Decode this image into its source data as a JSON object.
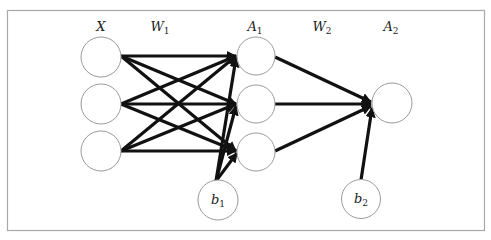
{
  "diagram": {
    "type": "neural-network",
    "colors": {
      "edge": "#111111",
      "node_stroke": "#9a9a9a",
      "frame": "#a8a8a8",
      "background": "#ffffff"
    },
    "labels": {
      "input": {
        "base": "X",
        "sub": ""
      },
      "weights1": {
        "base": "W",
        "sub": "1"
      },
      "hidden": {
        "base": "A",
        "sub": "1"
      },
      "weights2": {
        "base": "W",
        "sub": "2"
      },
      "output": {
        "base": "A",
        "sub": "2"
      },
      "bias1": {
        "base": "b",
        "sub": "1"
      },
      "bias2": {
        "base": "b",
        "sub": "2"
      }
    },
    "layers": {
      "input_nodes": 3,
      "hidden_nodes": 3,
      "output_nodes": 1
    },
    "connections": [
      "X (3 nodes) fully connected to A1 (3 nodes) via W1",
      "b1 connected to all A1 nodes",
      "A1 (3 nodes) fully connected to A2 (1 node) via W2",
      "b2 connected to A2"
    ]
  }
}
